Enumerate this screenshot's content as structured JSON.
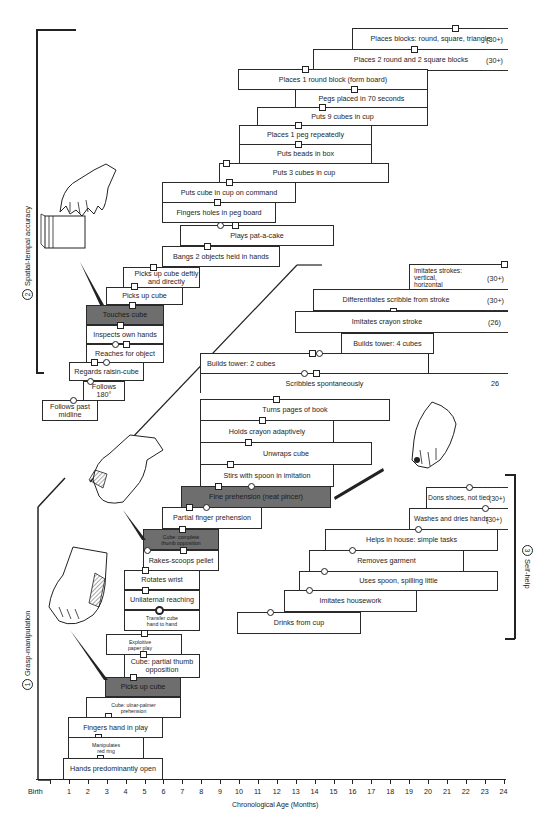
{
  "chart_data": {
    "type": "table",
    "xlabel": "Chronological Age (Months)",
    "x_ticks": [
      "Birth",
      "1",
      "2",
      "3",
      "4",
      "5",
      "6",
      "7",
      "8",
      "9",
      "10",
      "11",
      "12",
      "13",
      "14",
      "15",
      "16",
      "17",
      "18",
      "19",
      "20",
      "21",
      "22",
      "23",
      "24"
    ],
    "xlim": [
      0,
      24
    ],
    "sections": [
      {
        "number": "1",
        "name": "Grasp-manipulation"
      },
      {
        "number": "2",
        "name": "Spatial-tempal accuracy"
      },
      {
        "number": "3",
        "name": "Self-help"
      }
    ]
  },
  "axis": {
    "title": "Chronological Age (Months)",
    "ticks": [
      "Birth",
      "1",
      "2",
      "3",
      "4",
      "5",
      "6",
      "7",
      "8",
      "9",
      "10",
      "11",
      "12",
      "13",
      "14",
      "15",
      "16",
      "17",
      "18",
      "19",
      "20",
      "21",
      "22",
      "23",
      "24"
    ]
  },
  "sections": {
    "grasp": {
      "number": "1",
      "label": "Grasp-manipulation"
    },
    "spatial": {
      "number": "2",
      "label": "Spatial-tempal accuracy"
    },
    "selfhelp": {
      "number": "3",
      "label": "Self-help"
    }
  },
  "spatial_items": [
    {
      "label": "Places blocks:  round, square, triangle",
      "note": "(30+)"
    },
    {
      "label": "Places 2 round and 2 square blocks",
      "note": "(30+)"
    },
    {
      "label": "Places 1 round block (form board)"
    },
    {
      "label": "Pegs placed in 70 seconds"
    },
    {
      "label": "Puts 9 cubes in cup"
    },
    {
      "label": "Places 1 peg repeatedly"
    },
    {
      "label": "Puts beads in box"
    },
    {
      "label": "Puts 3 cubes in cup"
    },
    {
      "label": "Puts cube in cup on command"
    },
    {
      "label": "Fingers holes in peg board"
    },
    {
      "label": "Plays pat-a-cake"
    },
    {
      "label": "Bangs 2 objects held in hands"
    },
    {
      "label": "Picks up cube deftly and directly"
    },
    {
      "label": "Picks up cube"
    },
    {
      "label": "Touches cube",
      "highlighted": true
    },
    {
      "label": "Inspects own hands"
    },
    {
      "label": "Reaches for object"
    },
    {
      "label": "Regards raisin-cube"
    },
    {
      "label": "Follows 180°"
    },
    {
      "label": "Follows past midline"
    }
  ],
  "drawing_items": [
    {
      "label": "Imitates strokes: vertical, horizontal",
      "note": "(30+)"
    },
    {
      "label": "Differentiates scribble from stroke",
      "note": "(30+)"
    },
    {
      "label": "Imitates crayon stroke",
      "note": "(26)"
    },
    {
      "label": "Builds tower:  4 cubes"
    },
    {
      "label": "Builds tower:  2 cubes"
    },
    {
      "label": "Scribbles spontaneously",
      "note": "26"
    },
    {
      "label": "Turns pages of book"
    },
    {
      "label": "Holds crayon adaptively"
    },
    {
      "label": "Unwraps cube"
    },
    {
      "label": "Stirs with spoon in imitation"
    }
  ],
  "grasp_items": [
    {
      "label": "Fine prehension (neat pincer)",
      "highlighted": true
    },
    {
      "label": "Partial finger prehension"
    },
    {
      "label": "Cube: complete thumb opposition",
      "highlighted": true
    },
    {
      "label": "Rakes-scoops pellet"
    },
    {
      "label": "Rotates wrist"
    },
    {
      "label": "Unilaternal reaching"
    },
    {
      "label": "Transfer cube hand to hand"
    },
    {
      "label": "Exploitive paper play"
    },
    {
      "label": "Cube: partial thumb opposition"
    },
    {
      "label": "Picks up cube",
      "highlighted": true
    },
    {
      "label": "Cube: ulnar-palmer prehension"
    },
    {
      "label": "Fingers hand in play"
    },
    {
      "label": "Manipulates red ring"
    },
    {
      "label": "Hands predominantly open"
    }
  ],
  "selfhelp_items": [
    {
      "label": "Dons shoes, not tied",
      "note": "(30+)"
    },
    {
      "label": "Washes and dries hands",
      "note": "(30+)"
    },
    {
      "label": "Helps in house:  simple tasks"
    },
    {
      "label": "Removes garment"
    },
    {
      "label": "Uses spoon, spilling little"
    },
    {
      "label": "Imitates housework"
    },
    {
      "label": "Drinks from cup"
    }
  ],
  "colors": {
    "line": "#2a2a2a",
    "highlight_box": "#6e6e6e",
    "background": "#ffffff"
  }
}
